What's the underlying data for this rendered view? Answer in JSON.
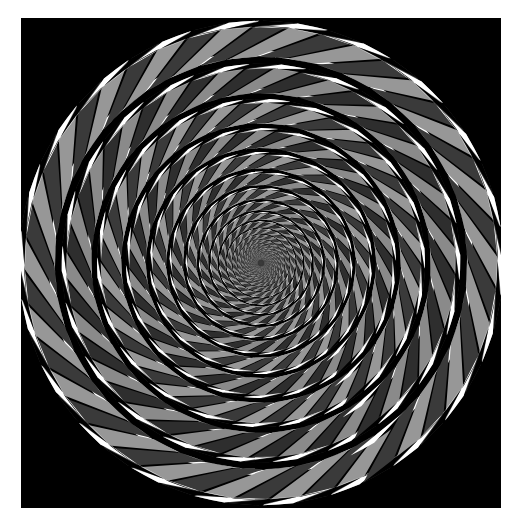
{
  "page": {
    "background_color": "#ffffff"
  },
  "panel": {
    "name": "illusion-canvas",
    "background_color": "#000000",
    "x": 21,
    "y": 18,
    "width": 480,
    "height": 490
  },
  "figure": {
    "type": "optical-illusion",
    "name": "pinna-brelstaff-concentric-rings",
    "center_x": 240,
    "center_y": 245,
    "outer_radius": 246,
    "inner_radius": 3.2,
    "ring_count": 22,
    "ring_growth_ratio": 1.215,
    "tiles_per_ring": 44,
    "tile_tilt_degrees": 18,
    "alternate_tilt_by_ring": true,
    "colors": {
      "background": "#000000",
      "tile_dark": "#2e2e2e",
      "tile_light": "#8a8a8a",
      "tile_dark_alt": "#3a3a3a",
      "tile_light_alt": "#979797",
      "edge_highlight": "#ffffff",
      "edge_shadow": "#000000",
      "center_haze": "#6b6b6b"
    },
    "edge_highlight_fraction": 0.17,
    "gap_fraction": 0.055
  }
}
